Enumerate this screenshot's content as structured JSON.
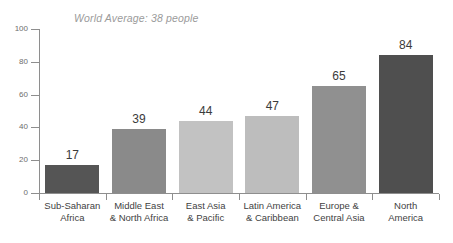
{
  "chart_data": {
    "type": "bar",
    "title": "",
    "annotation": "World Average: 38 people",
    "categories": [
      "Sub-Saharan Africa",
      "Middle East & North Africa",
      "East Asia & Pacific",
      "Latin America & Caribbean",
      "Europe & Central Asia",
      "North America"
    ],
    "category_lines": [
      [
        "Sub-Saharan",
        "Africa"
      ],
      [
        "Middle East",
        "& North Africa"
      ],
      [
        "East Asia",
        "& Pacific"
      ],
      [
        "Latin America",
        "& Caribbean"
      ],
      [
        "Europe &",
        "Central Asia"
      ],
      [
        "North",
        "America"
      ]
    ],
    "values": [
      17,
      39,
      44,
      47,
      65,
      84
    ],
    "value_labels": [
      "17",
      "39",
      "44",
      "47",
      "65",
      "84"
    ],
    "bar_colors": [
      "#555555",
      "#8a8a8a",
      "#c2c2c2",
      "#bdbdbd",
      "#909090",
      "#4f4f4f"
    ],
    "xlabel": "",
    "ylabel": "",
    "ylim": [
      0,
      100
    ],
    "yticks": [
      0,
      20,
      40,
      60,
      80,
      100
    ],
    "ytick_labels": [
      "0",
      "20",
      "40",
      "60",
      "80",
      "100"
    ],
    "grid": false,
    "legend": false,
    "axis_color": "#8e8e8e",
    "annotation_color": "#9b9b9b",
    "value_label_color": "#3b3b3b",
    "category_label_color": "#3f3f3f",
    "background": "#ffffff"
  }
}
